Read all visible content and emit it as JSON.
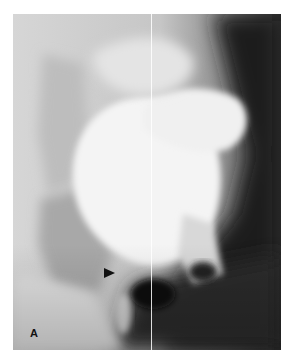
{
  "figure": {
    "panel_label": "A",
    "marker": "arrowhead-pointing-right"
  }
}
